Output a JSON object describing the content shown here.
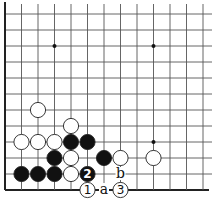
{
  "diagram": {
    "type": "go-board-diagram",
    "corner": "bottom-left",
    "grid": {
      "columns": 13,
      "rows": 12,
      "x0": 5,
      "y0": 14,
      "spacing_x": 16.5,
      "spacing_y": 16,
      "line_color": "#555555",
      "edge_color": "#222222",
      "edges": [
        "left",
        "bottom"
      ]
    },
    "star_points": [
      {
        "col": 3,
        "row": 2
      },
      {
        "col": 9,
        "row": 2
      },
      {
        "col": 9,
        "row": 8
      }
    ],
    "stones": [
      {
        "color": "white",
        "col": 2,
        "row": 6,
        "label": ""
      },
      {
        "color": "white",
        "col": 4,
        "row": 7,
        "label": ""
      },
      {
        "color": "white",
        "col": 1,
        "row": 8,
        "label": ""
      },
      {
        "color": "white",
        "col": 2,
        "row": 8,
        "label": ""
      },
      {
        "color": "white",
        "col": 3,
        "row": 8,
        "label": ""
      },
      {
        "color": "black",
        "col": 4,
        "row": 8,
        "label": ""
      },
      {
        "color": "black",
        "col": 5,
        "row": 8,
        "label": ""
      },
      {
        "color": "black",
        "col": 3,
        "row": 9,
        "label": ""
      },
      {
        "color": "white",
        "col": 4,
        "row": 9,
        "label": ""
      },
      {
        "color": "black",
        "col": 6,
        "row": 9,
        "label": ""
      },
      {
        "color": "white",
        "col": 7,
        "row": 9,
        "label": ""
      },
      {
        "color": "white",
        "col": 9,
        "row": 9,
        "label": ""
      },
      {
        "color": "black",
        "col": 1,
        "row": 10,
        "label": ""
      },
      {
        "color": "black",
        "col": 2,
        "row": 10,
        "label": ""
      },
      {
        "color": "black",
        "col": 3,
        "row": 10,
        "label": ""
      },
      {
        "color": "white",
        "col": 4,
        "row": 10,
        "label": ""
      },
      {
        "color": "black",
        "col": 5,
        "row": 10,
        "label": "2"
      },
      {
        "color": "white",
        "col": 5,
        "row": 11,
        "label": "1"
      },
      {
        "color": "white",
        "col": 7,
        "row": 11,
        "label": "3"
      }
    ],
    "letter_marks": [
      {
        "col": 7,
        "row": 10,
        "label": "b"
      },
      {
        "col": 6,
        "row": 11,
        "label": "a"
      }
    ]
  }
}
